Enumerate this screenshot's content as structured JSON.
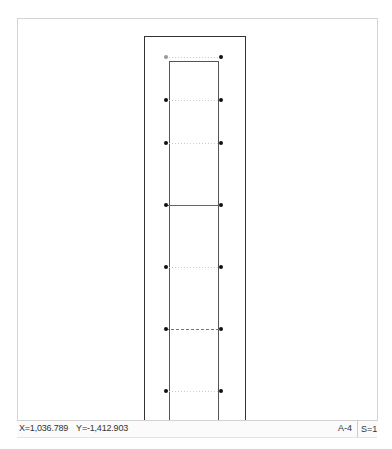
{
  "canvas": {
    "outer_rect": {
      "x": 126,
      "y": 17,
      "w": 101,
      "h": 400,
      "stroke": "#333333"
    },
    "inner_rect": {
      "x": 151,
      "y": 42,
      "w": 49,
      "h": 380,
      "stroke": "#555555"
    },
    "rows": [
      {
        "y": 38,
        "style": "dotted"
      },
      {
        "y": 81,
        "style": "dotted"
      },
      {
        "y": 124,
        "style": "dotted"
      },
      {
        "y": 186,
        "style": "solid"
      },
      {
        "y": 248,
        "style": "dotted"
      },
      {
        "y": 310,
        "style": "dashed"
      },
      {
        "y": 372,
        "style": "dotted"
      }
    ],
    "dot_left_x": 148,
    "dot_right_x": 203,
    "dot_color": "#111111",
    "first_dot_color": "#999999"
  },
  "statusbar": {
    "x_coord": "X=1,036.789",
    "y_coord": "Y=-1,412.903",
    "sheet": "A-4",
    "scale": "S=1"
  }
}
